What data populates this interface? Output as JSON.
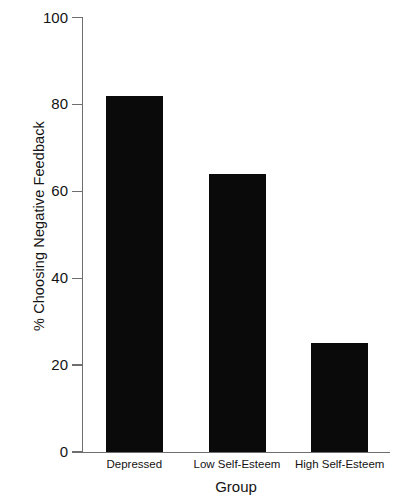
{
  "chart_data": {
    "type": "bar",
    "title": "",
    "subtitle": "",
    "xlabel": "Group",
    "ylabel": "% Choosing Negative Feedback",
    "categories": [
      "Depressed",
      "Low Self-Esteem",
      "High Self-Esteem"
    ],
    "values": [
      82,
      64,
      25
    ],
    "ylim": [
      0,
      100
    ],
    "xlim": [
      0,
      3
    ],
    "yticks": [
      0,
      20,
      40,
      60,
      80,
      100
    ],
    "ytick_labels": [
      "0",
      "20",
      "40",
      "60",
      "80",
      "100"
    ],
    "grid": false,
    "legend": null,
    "legend_position": "none",
    "bar_color": "#0a0a0a",
    "axis_color": "#6e6e6e",
    "background_color": "#ffffff",
    "annotations": []
  },
  "axes": {
    "y_title": "% Choosing Negative Feedback",
    "x_title": "Group"
  },
  "ticks": {
    "y": [
      {
        "label": "100",
        "value": 100
      },
      {
        "label": "80",
        "value": 80
      },
      {
        "label": "60",
        "value": 60
      },
      {
        "label": "40",
        "value": 40
      },
      {
        "label": "20",
        "value": 20
      },
      {
        "label": "0",
        "value": 0
      }
    ]
  },
  "bars": [
    {
      "label": "Depressed",
      "value": 82
    },
    {
      "label": "Low Self-Esteem",
      "value": 64
    },
    {
      "label": "High Self-Esteem",
      "value": 25
    }
  ]
}
